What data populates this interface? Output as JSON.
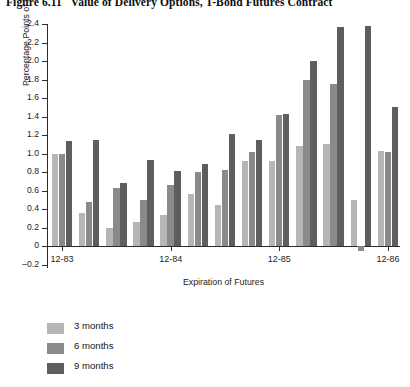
{
  "figure": {
    "number": "Figure 6.11",
    "title": "Value of Delivery Options, T-Bond Futures Contract"
  },
  "axes": {
    "ylabel": "Percentage Points of Par",
    "xlabel": "Expiration of Futures",
    "yticks": [
      "2.4",
      "2.2",
      "2.0",
      "1.8",
      "1.6",
      "1.4",
      "1.2",
      "1.0",
      "0.8",
      "0.6",
      "0.4",
      "0.2",
      "0",
      "-0.2"
    ],
    "xticks": [
      "12-83",
      "12-84",
      "12-85",
      "12-86"
    ]
  },
  "legend": {
    "items": [
      {
        "label": "3 months",
        "color": "#b6b6b6"
      },
      {
        "label": "6 months",
        "color": "#8a8a8a"
      },
      {
        "label": "9 months",
        "color": "#5e5e5e"
      }
    ]
  },
  "chart_data": {
    "type": "bar",
    "title": "Value of Delivery Options, T-Bond Futures Contract",
    "xlabel": "Expiration of Futures",
    "ylabel": "Percentage Points of Par",
    "ylim": [
      -0.2,
      2.4
    ],
    "ytick_step": 0.2,
    "grid": false,
    "legend_position": "below-left",
    "categories": [
      "12-83",
      "03-84",
      "06-84",
      "09-84",
      "12-84",
      "03-85",
      "06-85",
      "09-85",
      "12-85",
      "03-86",
      "06-86",
      "09-86",
      "12-86"
    ],
    "xtick_categories": [
      "12-83",
      "12-84",
      "12-85",
      "12-86"
    ],
    "series": [
      {
        "name": "3 months",
        "color": "#b6b6b6",
        "values": [
          1.0,
          0.36,
          0.2,
          0.26,
          0.34,
          0.56,
          0.44,
          0.92,
          0.92,
          1.08,
          1.1,
          0.5,
          1.03
        ]
      },
      {
        "name": "6 months",
        "color": "#8a8a8a",
        "values": [
          1.0,
          0.48,
          0.63,
          0.5,
          0.66,
          0.8,
          0.82,
          1.02,
          1.42,
          1.8,
          1.75,
          -0.05,
          1.02
        ]
      },
      {
        "name": "9 months",
        "color": "#5e5e5e",
        "values": [
          1.14,
          1.15,
          0.68,
          0.93,
          0.81,
          0.89,
          1.21,
          1.15,
          1.43,
          2.0,
          2.37,
          2.38,
          1.5
        ]
      }
    ]
  }
}
